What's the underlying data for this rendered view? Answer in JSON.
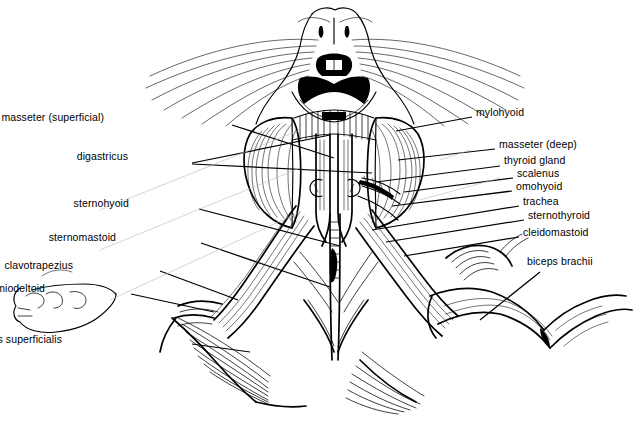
{
  "figure": {
    "style": "black-and-white line drawing, ink hatching",
    "background_color": "#ffffff",
    "ink_color": "#000000"
  },
  "labels_left": [
    {
      "id": "masseter-superficial",
      "text": "masseter (superficial)",
      "x": 104,
      "y": 118,
      "leaders": [
        {
          "x1": 232,
          "y1": 125,
          "x2": 334,
          "y2": 158
        }
      ]
    },
    {
      "id": "digastricus",
      "text": "digastricus",
      "x": 128,
      "y": 157,
      "leaders": [
        {
          "x1": 192,
          "y1": 163,
          "x2": 330,
          "y2": 135
        },
        {
          "x1": 192,
          "y1": 164,
          "x2": 372,
          "y2": 173
        }
      ]
    },
    {
      "id": "sternohyoid",
      "text": "sternohyoid",
      "x": 129,
      "y": 204,
      "leaders": [
        {
          "x1": 199,
          "y1": 209,
          "x2": 340,
          "y2": 246
        }
      ]
    },
    {
      "id": "sternomastoid",
      "text": "sternomastoid",
      "x": 116,
      "y": 238,
      "leaders": [
        {
          "x1": 201,
          "y1": 243,
          "x2": 330,
          "y2": 287
        }
      ]
    },
    {
      "id": "clavotrapezius",
      "text": "clavotrapezius",
      "x": 73,
      "y": 266,
      "leaders": [
        {
          "x1": 160,
          "y1": 271,
          "x2": 238,
          "y2": 300
        }
      ]
    },
    {
      "id": "acromiodeltoid",
      "text": "acromiodeltoid",
      "x": 45,
      "y": 289,
      "leaders": [
        {
          "x1": 131,
          "y1": 294,
          "x2": 214,
          "y2": 312
        }
      ]
    },
    {
      "id": "pectoralis-superficialis",
      "text": "pectoralis superficialis",
      "x": 62,
      "y": 340,
      "leaders": [
        {
          "x1": 192,
          "y1": 344,
          "x2": 250,
          "y2": 352
        }
      ]
    }
  ],
  "labels_right": [
    {
      "id": "mylohyoid",
      "text": "mylohyoid",
      "x": 476,
      "y": 113,
      "leaders": [
        {
          "x1": 472,
          "y1": 117,
          "x2": 396,
          "y2": 131
        }
      ]
    },
    {
      "id": "masseter-deep",
      "text": "masseter (deep)",
      "x": 499,
      "y": 145,
      "leaders": [
        {
          "x1": 495,
          "y1": 149,
          "x2": 398,
          "y2": 160
        }
      ]
    },
    {
      "id": "thyroid-gland",
      "text": "thyroid gland",
      "x": 504,
      "y": 161,
      "leaders": [
        {
          "x1": 500,
          "y1": 166,
          "x2": 376,
          "y2": 182
        }
      ]
    },
    {
      "id": "scalenus",
      "text": "scalenus",
      "x": 517,
      "y": 174,
      "leaders": [
        {
          "x1": 513,
          "y1": 178,
          "x2": 404,
          "y2": 192
        }
      ]
    },
    {
      "id": "omohyoid",
      "text": "omohyoid",
      "x": 516,
      "y": 187,
      "leaders": [
        {
          "x1": 512,
          "y1": 191,
          "x2": 392,
          "y2": 206
        }
      ]
    },
    {
      "id": "trachea",
      "text": "trachea",
      "x": 523,
      "y": 202,
      "leaders": [
        {
          "x1": 519,
          "y1": 206,
          "x2": 372,
          "y2": 230
        }
      ]
    },
    {
      "id": "sternothyroid",
      "text": "sternothyroid",
      "x": 528,
      "y": 216,
      "leaders": [
        {
          "x1": 524,
          "y1": 220,
          "x2": 386,
          "y2": 242
        }
      ]
    },
    {
      "id": "cleidomastoid",
      "text": "cleidomastoid",
      "x": 523,
      "y": 233,
      "leaders": [
        {
          "x1": 519,
          "y1": 237,
          "x2": 404,
          "y2": 256
        }
      ]
    },
    {
      "id": "biceps-brachii",
      "text": "biceps brachii",
      "x": 527,
      "y": 262,
      "leaders": [
        {
          "x1": 540,
          "y1": 272,
          "x2": 480,
          "y2": 320
        }
      ]
    }
  ],
  "anatomy_regions": [
    {
      "name": "muzzle-and-nose",
      "description": "ventral muzzle with nostrils and mouth"
    },
    {
      "name": "whiskers",
      "description": "vibrissae radiating laterally from muzzle"
    },
    {
      "name": "mylohyoid",
      "description": "transverse striated sheet beneath jaw"
    },
    {
      "name": "masseter-superficial",
      "description": "large left rounded jaw muscle"
    },
    {
      "name": "masseter-deep",
      "description": "right rounded jaw muscle"
    },
    {
      "name": "digastricus",
      "description": "paired midline strap muscles of jaw"
    },
    {
      "name": "sternohyoid",
      "description": "midline strap muscle of neck"
    },
    {
      "name": "sternothyroid",
      "description": "deep strap muscle lateral to trachea"
    },
    {
      "name": "trachea",
      "description": "segmented midline tube"
    },
    {
      "name": "thyroid-gland",
      "description": "small lobed gland on trachea"
    },
    {
      "name": "scalenus",
      "description": "lateral deep neck muscle"
    },
    {
      "name": "omohyoid",
      "description": "oblique narrow neck band"
    },
    {
      "name": "sternomastoid",
      "description": "oblique broad superficial neck muscle"
    },
    {
      "name": "cleidomastoid",
      "description": "deep oblique neck muscle"
    },
    {
      "name": "clavotrapezius",
      "description": "shoulder muscle from neck to clavicle"
    },
    {
      "name": "acromiodeltoid",
      "description": "shoulder muscle over acromion"
    },
    {
      "name": "pectoralis-superficialis",
      "description": "fan of chest fibers to midline"
    },
    {
      "name": "biceps-brachii",
      "description": "forelimb flexor on right arm"
    },
    {
      "name": "left-forepaw",
      "description": "outlined paw at far left"
    },
    {
      "name": "right-forelimb",
      "description": "extended right forelimb"
    }
  ]
}
